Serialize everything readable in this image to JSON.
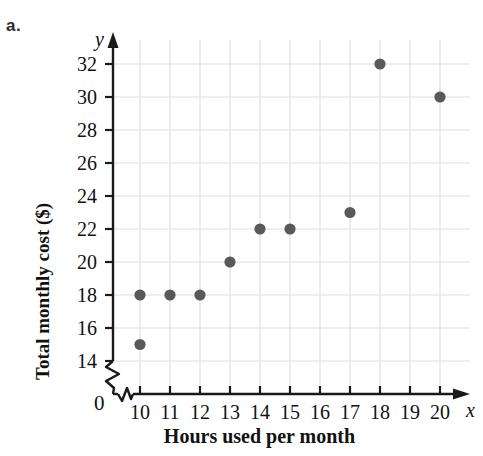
{
  "part_label": "a.",
  "chart_data": {
    "type": "scatter",
    "title": "",
    "xlabel": "Hours used per month",
    "ylabel": "Total monthly cost ($)",
    "x_axis_variable": "x",
    "y_axis_variable": "y",
    "origin_label": "0",
    "xlim": [
      9.3,
      20.8
    ],
    "ylim": [
      13.3,
      33.0
    ],
    "x_ticks": [
      10,
      11,
      12,
      13,
      14,
      15,
      16,
      17,
      18,
      19,
      20
    ],
    "y_ticks": [
      14,
      16,
      18,
      20,
      22,
      24,
      26,
      28,
      30,
      32
    ],
    "x_tick_labels": [
      "10",
      "11",
      "12",
      "13",
      "14",
      "15",
      "16",
      "17",
      "18",
      "19",
      "20"
    ],
    "y_tick_labels": [
      "14",
      "16",
      "18",
      "20",
      "22",
      "24",
      "26",
      "28",
      "30",
      "32"
    ],
    "axis_break_x": true,
    "axis_break_y": true,
    "grid": true,
    "legend": "none",
    "point_color": "#595959",
    "grid_color": "#e8e8e8",
    "axis_color": "#1a1a1a",
    "points": [
      {
        "x": 10,
        "y": 15
      },
      {
        "x": 10,
        "y": 18
      },
      {
        "x": 11,
        "y": 18
      },
      {
        "x": 12,
        "y": 18
      },
      {
        "x": 13,
        "y": 20
      },
      {
        "x": 14,
        "y": 22
      },
      {
        "x": 15,
        "y": 22
      },
      {
        "x": 17,
        "y": 23
      },
      {
        "x": 18,
        "y": 32
      },
      {
        "x": 20,
        "y": 30
      }
    ]
  }
}
